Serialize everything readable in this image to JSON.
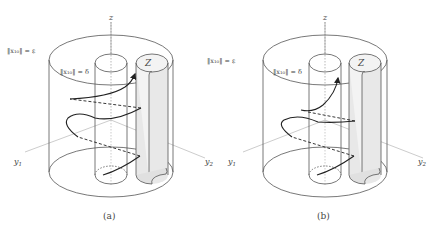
{
  "panels": [
    {
      "caption": "(a)",
      "axis_z": "z",
      "axis_y1": "y",
      "axis_y1_sub": "1",
      "axis_y2": "y",
      "axis_y2_sub": "2",
      "outer_label": "‖x₁₀‖ = ε",
      "inner_label": "‖x₁₀‖ = δ",
      "region_label": "Z"
    },
    {
      "caption": "(b)",
      "axis_z": "z",
      "axis_y1": "y",
      "axis_y1_sub": "1",
      "axis_y2": "y",
      "axis_y2_sub": "2",
      "outer_label": "‖x₁₀‖ = ε",
      "inner_label": "‖x₁₀‖ = δ",
      "region_label": "Z"
    }
  ],
  "colors": {
    "line": "#555555",
    "trajectory": "#222222",
    "shade": "#e6e6e6",
    "guide": "#999999"
  }
}
